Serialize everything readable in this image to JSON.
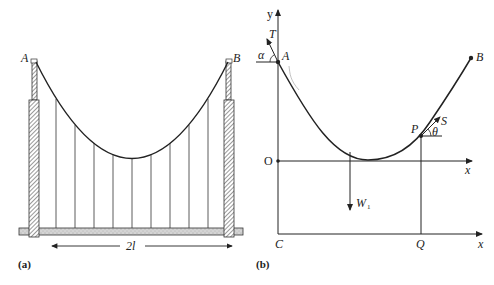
{
  "figure": {
    "panel_a": {
      "caption": "(a)",
      "label_left_tower": "A",
      "label_right_tower": "B",
      "span_label": "2l",
      "hanger_count": 9
    },
    "panel_b": {
      "caption": "(b)",
      "axis_y_label": "y",
      "axis_x_label": "x",
      "axis_x_label_lower": "x",
      "origin_label": "O",
      "point_A": "A",
      "point_B": "B",
      "point_P": "P",
      "point_C": "C",
      "point_Q": "Q",
      "tension_A": "T",
      "angle_A": "α",
      "tension_P": "S",
      "angle_P": "θ",
      "weight_label": "W",
      "weight_subscript": "1"
    }
  },
  "colors": {
    "ink": "#222222",
    "deck_fill": "#d8d8d8",
    "background": "#ffffff"
  }
}
